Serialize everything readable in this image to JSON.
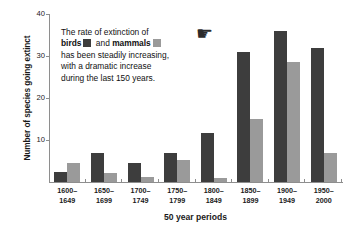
{
  "chart_data": {
    "type": "bar",
    "title": "",
    "xlabel": "50 year periods",
    "ylabel": "Number of species going extinct",
    "categories": [
      "1600–\n1649",
      "1650–\n1699",
      "1700–\n1749",
      "1750–\n1799",
      "1800–\n1849",
      "1850–\n1899",
      "1900–\n1949",
      "1950–\n2000"
    ],
    "categories_line1": [
      "1600–",
      "1650–",
      "1700–",
      "1750–",
      "1800–",
      "1850–",
      "1900–",
      "1950–"
    ],
    "categories_line2": [
      "1649",
      "1699",
      "1749",
      "1799",
      "1849",
      "1899",
      "1949",
      "2000"
    ],
    "series": [
      {
        "name": "birds",
        "color": "#3d3d3d",
        "values": [
          2.5,
          7,
          4.5,
          7,
          11.7,
          31,
          36,
          32
        ]
      },
      {
        "name": "mammals",
        "color": "#9a9a9a",
        "values": [
          4.5,
          2.2,
          1.2,
          5.2,
          1,
          15,
          28.5,
          7
        ]
      }
    ],
    "ylim": [
      0,
      40
    ],
    "yticks": [
      10,
      20,
      30,
      40
    ],
    "ytick_labels": [
      "10",
      "20",
      "30",
      "40"
    ],
    "grid": false,
    "legend_position": "inline-annotation"
  },
  "annotation": {
    "line1_prefix": "The rate of extinction of",
    "birds_label": "birds",
    "and_label": "and",
    "mammals_label": "mammals",
    "line3": "has been steadily increasing,",
    "line4": "with a dramatic increase",
    "line5": "during the last 150 years."
  },
  "icons": {
    "pointing_hand": "☛"
  },
  "colors": {
    "birds": "#3d3d3d",
    "mammals": "#9a9a9a",
    "axis": "#8e8e8e",
    "text": "#1a1a1a",
    "background": "#ffffff"
  }
}
